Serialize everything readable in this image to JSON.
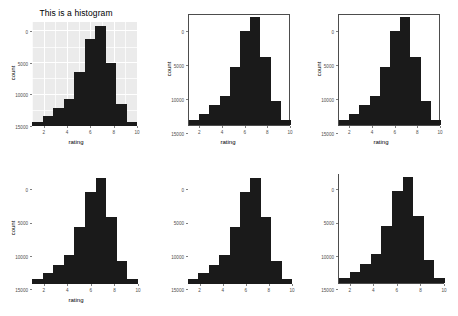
{
  "figure": {
    "kind": "multi-panel-histogram-figure",
    "panel_count": 6,
    "columns": 3,
    "rows": 2
  },
  "chart_data": [
    {
      "id": "panel-1",
      "type": "bar",
      "title": "This is a histogram",
      "xlabel": "rating",
      "ylabel": "count",
      "theme": "grey-background-white-gridlines",
      "xlim": [
        1,
        10
      ],
      "ylim": [
        0,
        16500
      ],
      "xticks": [
        "2",
        "4",
        "6",
        "8",
        "10"
      ],
      "xtick_values": [
        2,
        4,
        6,
        8,
        10
      ],
      "yticks": [
        "0",
        "5000",
        "10000",
        "15000"
      ],
      "ytick_values": [
        0,
        5000,
        10000,
        15000
      ],
      "bin_edges": [
        1,
        1.9,
        2.8,
        3.7,
        4.6,
        5.5,
        6.4,
        7.3,
        8.2,
        9.1,
        10
      ],
      "categories": [
        "1-1.9",
        "1.9-2.8",
        "2.8-3.7",
        "3.7-4.6",
        "4.6-5.5",
        "5.5-6.4",
        "6.4-7.3",
        "7.3-8.2",
        "8.2-9.1",
        "9.1-10"
      ],
      "values": [
        700,
        1600,
        2900,
        4300,
        8500,
        13800,
        15900,
        10000,
        3500,
        700
      ],
      "grid": true,
      "legend": "none",
      "show_title": true,
      "show_axis_titles": true,
      "show_tick_labels": true
    },
    {
      "id": "panel-2",
      "type": "bar",
      "title": "",
      "xlabel": "rating",
      "ylabel": "count",
      "theme": "white-background-full-border",
      "xlim": [
        1,
        10
      ],
      "ylim": [
        0,
        16500
      ],
      "xticks": [
        "2",
        "4",
        "6",
        "8",
        "10"
      ],
      "xtick_values": [
        2,
        4,
        6,
        8,
        10
      ],
      "yticks": [
        "0",
        "5000",
        "10000",
        "15000"
      ],
      "ytick_values": [
        0,
        5000,
        10000,
        15000
      ],
      "bin_edges": [
        1,
        1.9,
        2.8,
        3.7,
        4.6,
        5.5,
        6.4,
        7.3,
        8.2,
        9.1,
        10
      ],
      "categories": [
        "1-1.9",
        "1.9-2.8",
        "2.8-3.7",
        "3.7-4.6",
        "4.6-5.5",
        "5.5-6.4",
        "6.4-7.3",
        "7.3-8.2",
        "8.2-9.1",
        "9.1-10"
      ],
      "values": [
        700,
        1600,
        2900,
        4300,
        8500,
        13800,
        15900,
        10000,
        3500,
        700
      ],
      "grid": false,
      "legend": "none",
      "show_title": false,
      "show_axis_titles": true,
      "show_tick_labels": true
    },
    {
      "id": "panel-3",
      "type": "bar",
      "title": "",
      "xlabel": "rating",
      "ylabel": "count",
      "theme": "white-background-full-border",
      "xlim": [
        1,
        10
      ],
      "ylim": [
        0,
        16500
      ],
      "xticks": [
        "2",
        "4",
        "6",
        "8",
        "10"
      ],
      "xtick_values": [
        2,
        4,
        6,
        8,
        10
      ],
      "yticks": [
        "0",
        "5000",
        "10000",
        "15000"
      ],
      "ytick_values": [
        0,
        5000,
        10000,
        15000
      ],
      "bin_edges": [
        1,
        1.9,
        2.8,
        3.7,
        4.6,
        5.5,
        6.4,
        7.3,
        8.2,
        9.1,
        10
      ],
      "categories": [
        "1-1.9",
        "1.9-2.8",
        "2.8-3.7",
        "3.7-4.6",
        "4.6-5.5",
        "5.5-6.4",
        "6.4-7.3",
        "7.3-8.2",
        "8.2-9.1",
        "9.1-10"
      ],
      "values": [
        700,
        1600,
        2900,
        4300,
        8500,
        13800,
        15900,
        10000,
        3500,
        700
      ],
      "grid": false,
      "legend": "none",
      "show_title": false,
      "show_axis_titles": true,
      "show_tick_labels": true
    },
    {
      "id": "panel-4",
      "type": "bar",
      "title": "",
      "xlabel": "rating",
      "ylabel": "count",
      "theme": "minimal-no-panel-border",
      "xlim": [
        1,
        10
      ],
      "ylim": [
        0,
        16500
      ],
      "xticks": [
        "2",
        "4",
        "6",
        "8",
        "10"
      ],
      "xtick_values": [
        2,
        4,
        6,
        8,
        10
      ],
      "yticks": [
        "0",
        "5000",
        "10000",
        "15000"
      ],
      "ytick_values": [
        0,
        5000,
        10000,
        15000
      ],
      "bin_edges": [
        1,
        1.9,
        2.8,
        3.7,
        4.6,
        5.5,
        6.4,
        7.3,
        8.2,
        9.1,
        10
      ],
      "categories": [
        "1-1.9",
        "1.9-2.8",
        "2.8-3.7",
        "3.7-4.6",
        "4.6-5.5",
        "5.5-6.4",
        "6.4-7.3",
        "7.3-8.2",
        "8.2-9.1",
        "9.1-10"
      ],
      "values": [
        700,
        1600,
        2900,
        4300,
        8500,
        13800,
        15900,
        10000,
        3500,
        700
      ],
      "grid": false,
      "legend": "none",
      "show_title": false,
      "show_axis_titles": true,
      "show_tick_labels": true
    },
    {
      "id": "panel-5",
      "type": "bar",
      "title": "",
      "xlabel": "",
      "ylabel": "",
      "theme": "minimal-no-panel-border-no-axis-titles",
      "xlim": [
        1,
        10
      ],
      "ylim": [
        0,
        16500
      ],
      "xticks": [
        "2",
        "4",
        "6",
        "8",
        "10"
      ],
      "xtick_values": [
        2,
        4,
        6,
        8,
        10
      ],
      "yticks": [
        "0",
        "5000",
        "10000",
        "15000"
      ],
      "ytick_values": [
        0,
        5000,
        10000,
        15000
      ],
      "bin_edges": [
        1,
        1.9,
        2.8,
        3.7,
        4.6,
        5.5,
        6.4,
        7.3,
        8.2,
        9.1,
        10
      ],
      "categories": [
        "1-1.9",
        "1.9-2.8",
        "2.8-3.7",
        "3.7-4.6",
        "4.6-5.5",
        "5.5-6.4",
        "6.4-7.3",
        "7.3-8.2",
        "8.2-9.1",
        "9.1-10"
      ],
      "values": [
        700,
        1600,
        2900,
        4300,
        8500,
        13800,
        15900,
        10000,
        3500,
        700
      ],
      "grid": false,
      "legend": "none",
      "show_title": false,
      "show_axis_titles": false,
      "show_tick_labels": true
    },
    {
      "id": "panel-6",
      "type": "bar",
      "title": "",
      "xlabel": "",
      "ylabel": "",
      "theme": "classic-L-shaped-axis-lines",
      "xlim": [
        1,
        10
      ],
      "ylim": [
        0,
        16500
      ],
      "xticks": [
        "2",
        "4",
        "6",
        "8",
        "10"
      ],
      "xtick_values": [
        2,
        4,
        6,
        8,
        10
      ],
      "yticks": [
        "0",
        "5000",
        "10000",
        "15000"
      ],
      "ytick_values": [
        0,
        5000,
        10000,
        15000
      ],
      "bin_edges": [
        1,
        1.9,
        2.8,
        3.7,
        4.6,
        5.5,
        6.4,
        7.3,
        8.2,
        9.1,
        10
      ],
      "categories": [
        "1-1.9",
        "1.9-2.8",
        "2.8-3.7",
        "3.7-4.6",
        "4.6-5.5",
        "5.5-6.4",
        "6.4-7.3",
        "7.3-8.2",
        "8.2-9.1",
        "9.1-10"
      ],
      "values": [
        700,
        1600,
        2900,
        4300,
        8500,
        13800,
        15900,
        10000,
        3500,
        700
      ],
      "grid": false,
      "legend": "none",
      "show_title": false,
      "show_axis_titles": false,
      "show_tick_labels": true
    }
  ],
  "colors": {
    "bar_fill": "#1a1a1a",
    "panel_grey": "#ebebeb",
    "gridline_white": "#ffffff",
    "axis_text": "#4d4d4d",
    "axis_line": "#4d4d4d",
    "title_text": "#000000",
    "background": "#ffffff"
  }
}
